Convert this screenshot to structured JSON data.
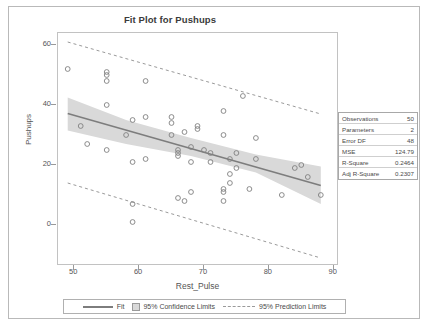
{
  "title": "Fit Plot for Pushups",
  "axes": {
    "xlabel": "Rest_Pulse",
    "ylabel": "Pushups",
    "xticks": [
      50,
      60,
      70,
      80,
      90
    ],
    "yticks": [
      0,
      20,
      40,
      60
    ]
  },
  "stats": {
    "rows": [
      {
        "key": "Observations",
        "value": "50"
      },
      {
        "key": "Parameters",
        "value": "2"
      },
      {
        "key": "Error DF",
        "value": "48"
      },
      {
        "key": "MSE",
        "value": "124.79"
      },
      {
        "key": "R-Square",
        "value": "0.2464"
      },
      {
        "key": "Adj R-Square",
        "value": "0.2307"
      }
    ]
  },
  "legend": {
    "fit": "Fit",
    "confidence": "95% Confidence Limits",
    "prediction": "95% Prediction Limits"
  },
  "colors": {
    "fit_line": "#7d7d7d",
    "band_fill": "#d9d9d9",
    "limit_line": "#9a9a9a",
    "marker": "#808080",
    "frame": "#c2c2c2",
    "text": "#555555"
  },
  "chart_data": {
    "type": "scatter",
    "title": "Fit Plot for Pushups",
    "xlabel": "Rest_Pulse",
    "ylabel": "Pushups",
    "xlim": [
      47.5,
      90.5
    ],
    "ylim": [
      -13,
      64
    ],
    "grid": false,
    "legend_position": "bottom",
    "n_observations": 50,
    "points": [
      [
        49,
        52
      ],
      [
        51,
        33
      ],
      [
        52,
        27
      ],
      [
        55,
        51
      ],
      [
        55,
        50
      ],
      [
        55,
        48
      ],
      [
        55,
        40
      ],
      [
        55,
        25
      ],
      [
        58,
        30
      ],
      [
        59,
        21
      ],
      [
        59,
        35
      ],
      [
        59,
        7
      ],
      [
        59,
        1
      ],
      [
        61,
        36
      ],
      [
        61,
        22
      ],
      [
        61,
        48
      ],
      [
        65,
        36
      ],
      [
        65,
        34
      ],
      [
        65,
        30
      ],
      [
        66,
        25
      ],
      [
        66,
        24
      ],
      [
        66,
        23
      ],
      [
        66,
        9
      ],
      [
        67,
        8
      ],
      [
        67,
        31
      ],
      [
        68,
        26
      ],
      [
        68,
        21
      ],
      [
        68,
        11
      ],
      [
        69,
        33
      ],
      [
        69,
        32
      ],
      [
        70,
        25
      ],
      [
        71,
        24
      ],
      [
        71,
        21
      ],
      [
        73,
        38
      ],
      [
        73,
        30
      ],
      [
        73,
        12
      ],
      [
        73,
        11
      ],
      [
        73,
        8
      ],
      [
        74,
        22
      ],
      [
        74,
        17
      ],
      [
        74,
        14
      ],
      [
        75,
        19
      ],
      [
        75,
        24
      ],
      [
        76,
        43
      ],
      [
        77,
        12
      ],
      [
        78,
        22
      ],
      [
        78,
        29
      ],
      [
        82,
        10
      ],
      [
        84,
        19
      ],
      [
        85,
        20
      ],
      [
        86,
        16
      ],
      [
        88,
        10
      ]
    ],
    "fit_line": {
      "name": "Fit",
      "x": [
        49,
        88
      ],
      "y": [
        37.2,
        13.2
      ],
      "slope": -0.615,
      "intercept": 67.4
    },
    "confidence_band": {
      "name": "95% Confidence Limits",
      "x": [
        49,
        58,
        68,
        78,
        88
      ],
      "upper": [
        42.5,
        35.0,
        29.0,
        23.5,
        19.5
      ],
      "lower": [
        31.5,
        27.0,
        23.0,
        17.5,
        7.0
      ]
    },
    "prediction_limits": {
      "name": "95% Prediction Limits",
      "x": [
        49,
        88
      ],
      "upper": [
        61.0,
        37.0
      ],
      "lower": [
        14.0,
        -11.0
      ]
    }
  }
}
